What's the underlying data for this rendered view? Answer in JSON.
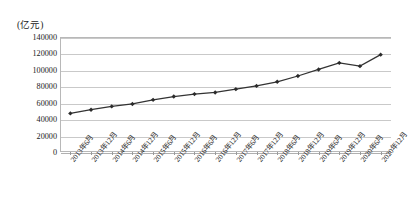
{
  "chart_data": {
    "type": "line",
    "title": "",
    "subtitle": "",
    "unit_label": "(亿元)",
    "xlabel": "",
    "ylabel": "",
    "ylim": [
      0,
      140000
    ],
    "yticks": [
      0,
      20000,
      40000,
      60000,
      80000,
      100000,
      120000,
      140000
    ],
    "ytick_labels": [
      "0",
      "20000",
      "40000",
      "60000",
      "80000",
      "100000",
      "120000",
      "140000"
    ],
    "grid": true,
    "legend": "none",
    "categories": [
      "2013年6月",
      "2013年12月",
      "2014年6月",
      "2014年12月",
      "2015年6月",
      "2015年12月",
      "2016年6月",
      "2016年12月",
      "2017年6月",
      "2017年12月",
      "2018年6月",
      "2018年12月",
      "2019年6月",
      "2019年12月",
      "2020年6月",
      "2020年12月"
    ],
    "values": [
      47000,
      51500,
      55500,
      58500,
      63500,
      67500,
      70500,
      72500,
      76500,
      80500,
      85500,
      92500,
      100500,
      108500,
      104500,
      118500
    ],
    "series": [
      {
        "name": "",
        "color": "#333333",
        "marker": "diamond",
        "values": [
          47000,
          51500,
          55500,
          58500,
          63500,
          67500,
          70500,
          72500,
          76500,
          80500,
          85500,
          92500,
          100500,
          108500,
          104500,
          118500
        ]
      }
    ]
  }
}
